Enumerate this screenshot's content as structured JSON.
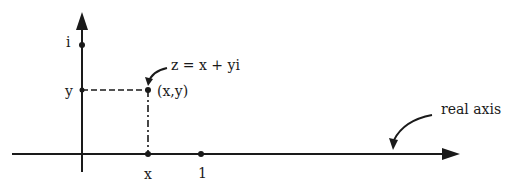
{
  "diagram": {
    "colors": {
      "ink": "#1a1a1a",
      "background": "#ffffff"
    },
    "labels": {
      "imag_unit": "i",
      "y_tick": "y",
      "x_tick": "x",
      "one_tick": "1",
      "point": "(x,y)",
      "formula": "z = x + yi",
      "real_axis": "real axis"
    },
    "points": [
      {
        "name": "i",
        "x": 0,
        "y": 1
      },
      {
        "name": "y",
        "x": 0,
        "y": "y"
      },
      {
        "name": "z",
        "x": "x",
        "y": "y"
      },
      {
        "name": "x",
        "x": "x",
        "y": 0
      },
      {
        "name": "1",
        "x": 1,
        "y": 0
      }
    ]
  }
}
